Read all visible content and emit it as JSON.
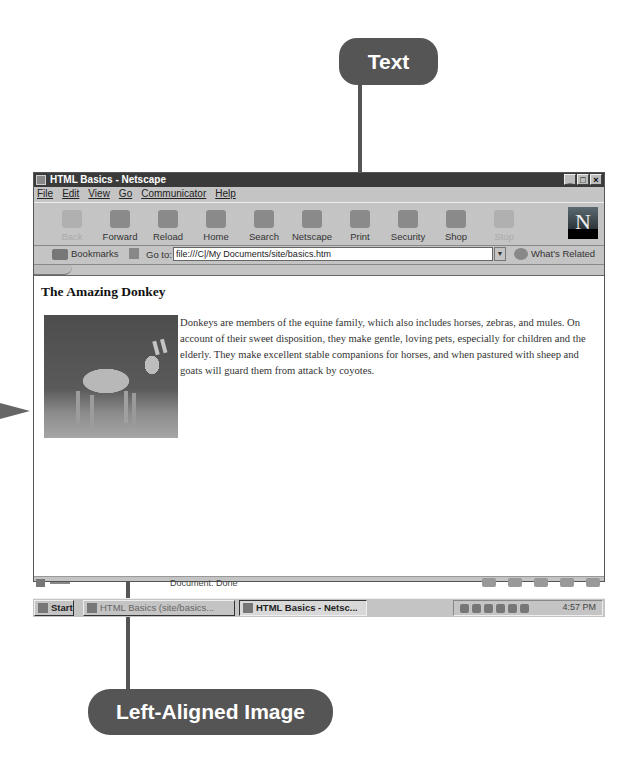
{
  "callouts": {
    "text": "Text",
    "image": "Left-Aligned Image"
  },
  "window": {
    "title": "HTML Basics - Netscape",
    "controls": {
      "minimize": "_",
      "maximize": "□",
      "close": "×"
    }
  },
  "menu": [
    "File",
    "Edit",
    "View",
    "Go",
    "Communicator",
    "Help"
  ],
  "toolbar": [
    {
      "label": "Back",
      "icon": "back-arrow-icon",
      "disabled": true
    },
    {
      "label": "Forward",
      "icon": "forward-arrow-icon",
      "disabled": false
    },
    {
      "label": "Reload",
      "icon": "reload-icon",
      "disabled": false
    },
    {
      "label": "Home",
      "icon": "home-icon",
      "disabled": false
    },
    {
      "label": "Search",
      "icon": "search-icon",
      "disabled": false
    },
    {
      "label": "Netscape",
      "icon": "netscape-icon",
      "disabled": false
    },
    {
      "label": "Print",
      "icon": "print-icon",
      "disabled": false
    },
    {
      "label": "Security",
      "icon": "security-icon",
      "disabled": false
    },
    {
      "label": "Shop",
      "icon": "shop-icon",
      "disabled": false
    },
    {
      "label": "Stop",
      "icon": "stop-icon",
      "disabled": true
    }
  ],
  "location": {
    "bookmarks": "Bookmarks",
    "goto_label": "Go to:",
    "url": "file:///C|/My Documents/site/basics.htm",
    "related": "What's Related"
  },
  "page": {
    "heading": "The Amazing Donkey",
    "paragraph": "Donkeys are members of the equine family, which also includes horses, zebras, and mules. On account of their sweet disposition, they make gentle, loving pets, especially for children and the elderly. They make excellent stable companions for horses, and when pastured with sheep and goats will guard them from attack by coyotes."
  },
  "status": {
    "text": "Document: Done"
  },
  "taskbar": {
    "start": "Start",
    "tasks": [
      "HTML Basics (site/basics...",
      "HTML Basics - Netsc..."
    ],
    "clock": "4:57 PM"
  },
  "colors": {
    "callout": "#555555",
    "titlebar": "#3a3a3a",
    "chrome": "#c4c4c4"
  }
}
